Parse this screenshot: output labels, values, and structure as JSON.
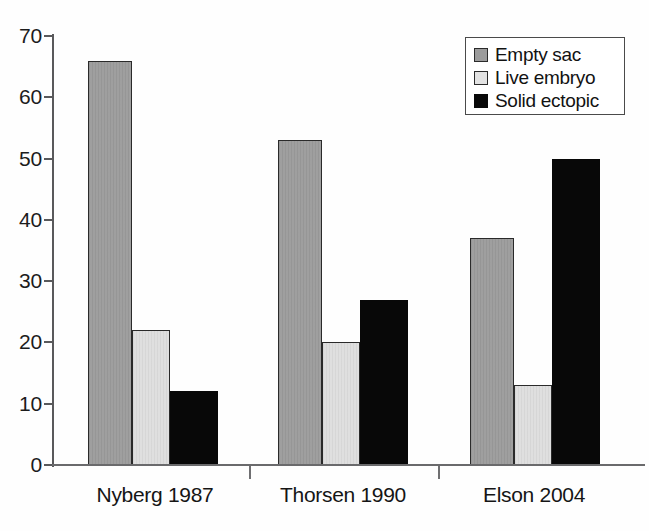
{
  "chart_data": {
    "type": "bar",
    "title": "",
    "subtitle": "",
    "xlabel": "",
    "ylabel": "",
    "categories": [
      "Nyberg 1987",
      "Thorsen 1990",
      "Elson 2004"
    ],
    "series": [
      {
        "name": "Empty sac",
        "key": "empty_sac",
        "color": "#9b9b9b",
        "values": [
          66,
          53,
          37
        ]
      },
      {
        "name": "Live embryo",
        "key": "live_embryo",
        "color": "#dedede",
        "values": [
          22,
          20,
          13
        ]
      },
      {
        "name": "Solid ectopic",
        "key": "solid_ectopic",
        "color": "#080808",
        "values": [
          12,
          27,
          50
        ]
      }
    ],
    "ylim": [
      0,
      70
    ],
    "ytick_values": [
      0,
      10,
      20,
      30,
      40,
      50,
      60,
      70
    ],
    "ytick_labels": [
      "0",
      "10",
      "20",
      "30",
      "40",
      "50",
      "60",
      "70"
    ],
    "grid": false,
    "legend_position": "top-right",
    "legend_entries": [
      "Empty sac",
      "Live embryo",
      "Solid ectopic"
    ],
    "annotations": []
  },
  "axes": {
    "y_axis_color": "#59595b",
    "x_axis_color": "#6a6a6c",
    "tick_color": "#59595b",
    "label_color": "#1c1c1c"
  },
  "legend": {
    "border_color": "#4a4a4a",
    "background": "#ffffff"
  },
  "background": "#fefefe"
}
